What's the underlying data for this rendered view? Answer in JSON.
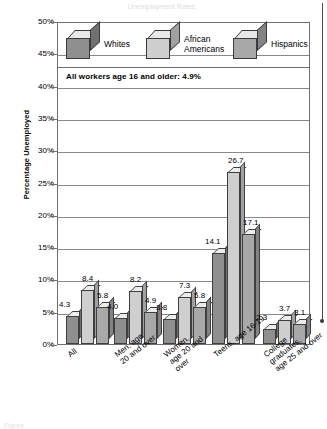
{
  "figure": {
    "top_title": "Unemployment Rates",
    "caption": "Figure",
    "annotation": "All workers age 16 and older: 4.9%"
  },
  "chart_data": {
    "type": "bar",
    "title": "Unemployment Rates",
    "xlabel": "",
    "ylabel": "Percentage Unemployed",
    "ylim": [
      0,
      50
    ],
    "ytick_labels": [
      "0%",
      "5%",
      "10%",
      "15%",
      "20%",
      "25%",
      "30%",
      "35%",
      "40%",
      "45%",
      "50%"
    ],
    "ytick_values": [
      0,
      5,
      10,
      15,
      20,
      25,
      30,
      35,
      40,
      45,
      50
    ],
    "grid": true,
    "legend_position": "top-inside",
    "categories": [
      "All",
      "Men, age\n20 and over",
      "Women,\nage 20 and\nover",
      "Teens, age 16-19",
      "College graduates,\nage 25 and over"
    ],
    "series": [
      {
        "name": "Whites",
        "color": "#8f8f8f",
        "values": [
          4.3,
          4.0,
          3.8,
          14.1,
          2.3
        ]
      },
      {
        "name": "African\nAmericans",
        "color": "#cfcfcf",
        "values": [
          8.4,
          8.2,
          7.3,
          26.7,
          3.7
        ]
      },
      {
        "name": "Hispanics",
        "color": "#a8a8a8",
        "values": [
          5.8,
          4.9,
          5.8,
          17.1,
          3.1
        ]
      }
    ],
    "annotations": [
      "All workers age 16 and older: 4.9%"
    ]
  }
}
